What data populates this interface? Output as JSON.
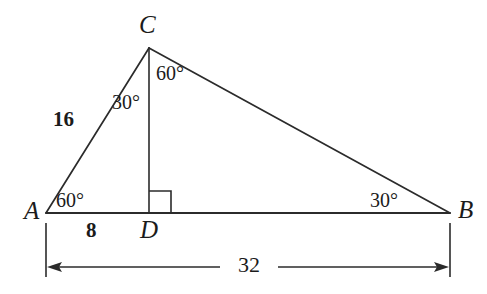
{
  "figure": {
    "kind": "geometry-diagram",
    "stroke_color": "#2b2b2b",
    "text_color": "#1b1b1b",
    "background_color": "#ffffff",
    "vertices": [
      {
        "name": "A",
        "label": "A",
        "x": 46,
        "y": 213
      },
      {
        "name": "B",
        "label": "B",
        "x": 450,
        "y": 213
      },
      {
        "name": "C",
        "label": "C",
        "x": 149,
        "y": 48
      },
      {
        "name": "D",
        "label": "D",
        "x": 149,
        "y": 213
      }
    ],
    "segments": [
      {
        "name": "segment-AB",
        "x1": 46,
        "y1": 213,
        "x2": 450,
        "y2": 213
      },
      {
        "name": "segment-AC",
        "x1": 46,
        "y1": 213,
        "x2": 149,
        "y2": 48
      },
      {
        "name": "segment-CB",
        "x1": 149,
        "y1": 48,
        "x2": 450,
        "y2": 213
      },
      {
        "name": "segment-CD-altitude",
        "x1": 149,
        "y1": 48,
        "x2": 149,
        "y2": 213
      }
    ],
    "right_angle_mark": {
      "name": "right-angle-at-D",
      "points": "149,192 170,192 170,213"
    },
    "angles": [
      {
        "name": "angle-at-A",
        "value": "60°",
        "x": 55,
        "y": 189
      },
      {
        "name": "angle-ACD",
        "value": "30°",
        "x": 112,
        "y": 91
      },
      {
        "name": "angle-DCB",
        "value": "60°",
        "x": 155,
        "y": 62
      },
      {
        "name": "angle-at-B",
        "value": "30°",
        "x": 369,
        "y": 189
      }
    ],
    "side_lengths": [
      {
        "name": "length-AC",
        "value": "16",
        "x": 53,
        "y": 108
      },
      {
        "name": "length-AD",
        "value": "8",
        "x": 85,
        "y": 219
      }
    ],
    "dimension": {
      "name": "dimension-AB",
      "value": "32",
      "label_x": 248,
      "label_y": 254,
      "line_y": 267,
      "left_x": 46,
      "right_x": 450,
      "ext_top_y": 223,
      "ext_bottom_y": 277,
      "gap_left": 216,
      "gap_right": 281
    }
  }
}
